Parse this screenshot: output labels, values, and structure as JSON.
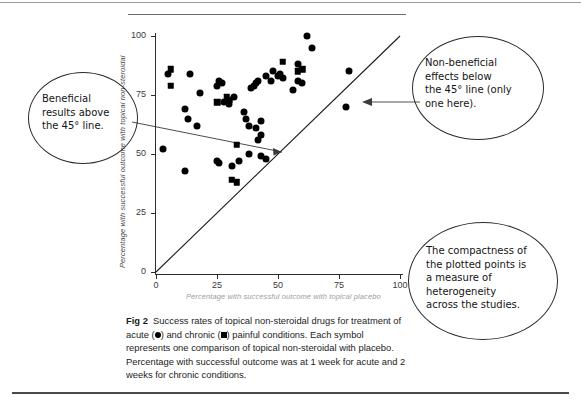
{
  "figure": {
    "label": "Fig 2",
    "caption_line1": "Success rates of topical non-steroidal drugs for treatment of",
    "caption_line2a": "acute (",
    "caption_line2b": ") and chronic (",
    "caption_line2c": ") painful conditions. Each symbol",
    "caption_line3": "represents one comparison of topical non-steroidal with placebo.",
    "caption_line4": "Percentage with successful outcome was at 1 week for acute and 2",
    "caption_line5": "weeks for chronic conditions."
  },
  "annotations": {
    "left": "Beneficial\nresults above\nthe 45° line.",
    "right_top": "Non-beneficial\neffects below\nthe 45° line (only\none here).",
    "right_bottom": "The compactness of\nthe plotted points is\na measure of\nheterogeneity\nacross the studies."
  },
  "chart_data": {
    "type": "scatter",
    "title": "",
    "xlabel": "Percentage with successful outcome with topical placebo",
    "ylabel": "Percentage with successful outcome with topical non-steroidal",
    "xlim": [
      0,
      100
    ],
    "ylim": [
      0,
      100
    ],
    "xticks": [
      0,
      25,
      50,
      75,
      100
    ],
    "yticks": [
      0,
      25,
      50,
      75,
      100
    ],
    "grid": false,
    "legend": "none",
    "reference_line": {
      "name": "line of equality (45 degrees)",
      "from": [
        0,
        0
      ],
      "to": [
        100,
        100
      ]
    },
    "series": [
      {
        "name": "acute painful conditions",
        "marker": "circle",
        "color": "#000000",
        "points": [
          [
            3,
            52
          ],
          [
            5,
            84
          ],
          [
            12,
            69
          ],
          [
            12,
            43
          ],
          [
            13,
            65
          ],
          [
            14,
            84
          ],
          [
            17,
            62
          ],
          [
            18,
            76
          ],
          [
            25,
            79
          ],
          [
            25,
            47
          ],
          [
            26,
            46
          ],
          [
            26,
            81
          ],
          [
            27,
            80
          ],
          [
            28,
            72
          ],
          [
            30,
            71
          ],
          [
            31,
            45
          ],
          [
            32,
            74
          ],
          [
            34,
            47
          ],
          [
            36,
            68
          ],
          [
            37,
            65
          ],
          [
            38,
            62
          ],
          [
            38,
            50
          ],
          [
            39,
            78
          ],
          [
            40,
            79
          ],
          [
            41,
            61
          ],
          [
            41,
            80
          ],
          [
            42,
            81
          ],
          [
            42,
            56
          ],
          [
            43,
            64
          ],
          [
            43,
            58
          ],
          [
            43,
            49
          ],
          [
            45,
            83
          ],
          [
            45,
            48
          ],
          [
            47,
            81
          ],
          [
            48,
            85
          ],
          [
            50,
            83
          ],
          [
            51,
            84
          ],
          [
            52,
            82
          ],
          [
            56,
            77
          ],
          [
            58,
            88
          ],
          [
            58,
            81
          ],
          [
            60,
            80
          ],
          [
            62,
            100
          ],
          [
            64,
            95
          ],
          [
            79,
            85
          ],
          [
            78,
            70
          ]
        ]
      },
      {
        "name": "chronic painful conditions",
        "marker": "square",
        "color": "#000000",
        "points": [
          [
            6,
            86
          ],
          [
            6,
            79
          ],
          [
            25,
            72
          ],
          [
            29,
            74
          ],
          [
            30,
            73
          ],
          [
            31,
            39
          ],
          [
            33,
            38
          ],
          [
            33,
            54
          ],
          [
            52,
            89
          ],
          [
            58,
            85
          ],
          [
            60,
            86
          ]
        ]
      }
    ]
  }
}
